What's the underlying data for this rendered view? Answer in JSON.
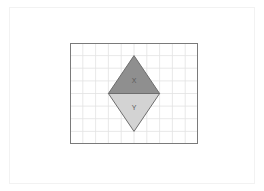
{
  "page": {
    "background_color": "#ffffff",
    "frame_color": "#f2f2f2"
  },
  "figure": {
    "title": "",
    "grid": {
      "columns": 10,
      "rows": 8,
      "cell_width": 12.8,
      "cell_height": 12.6,
      "line_color": "#e2e2e2",
      "border_color": "#7a7a7a",
      "border_width": 1
    },
    "shape": {
      "name": "rhombus-split-into-two-triangles",
      "outline_color": "#6e6e6e",
      "vertices": {
        "top": {
          "col": 5,
          "row": 1
        },
        "left": {
          "col": 3,
          "row": 4
        },
        "right": {
          "col": 7,
          "row": 4
        },
        "bottom": {
          "col": 5,
          "row": 7
        }
      },
      "parts": [
        {
          "id": "upper-triangle",
          "label": "X",
          "fill_color": "#8f8f8f",
          "label_position": {
            "col": 5,
            "row": 3
          }
        },
        {
          "id": "lower-triangle",
          "label": "Y",
          "fill_color": "#d3d3d3",
          "label_position": {
            "col": 5,
            "row": 5.2
          }
        }
      ],
      "diagonal_color": "#6e6e6e"
    }
  }
}
